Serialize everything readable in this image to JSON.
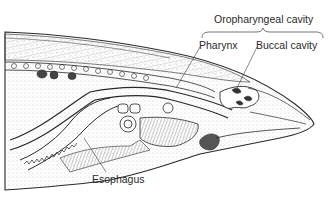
{
  "diagram": {
    "labels": {
      "oropharyngeal_cavity": "Oropharyngeal cavity",
      "pharynx": "Pharynx",
      "buccal_cavity": "Buccal cavity",
      "esophagus": "Esophagus"
    },
    "colors": {
      "ink": "#2a2a2a",
      "background": "#ffffff",
      "shading": "#9a9a9a"
    }
  }
}
